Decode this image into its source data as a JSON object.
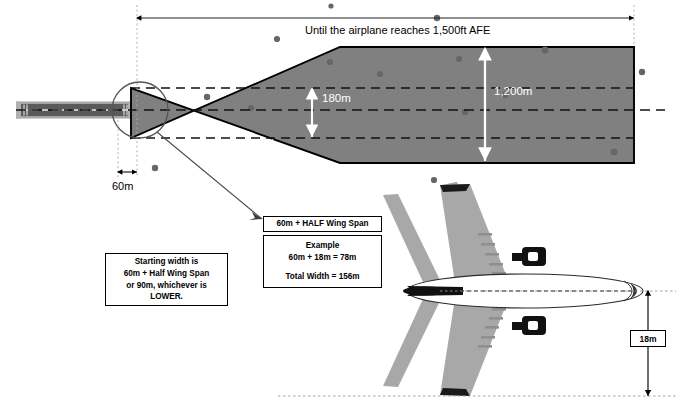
{
  "diagram": {
    "title_note": "Until the airplane reaches 1,500ft AFE",
    "splay": {
      "upper_percent_label": "12.5%",
      "lower_percent_label": "12.5%",
      "inner_corridor_label": "180m",
      "full_width_label": "1,200m",
      "start_width_label": "60m"
    },
    "notes": {
      "starting_width_box": {
        "line1": "Starting width is",
        "line2": "60m + Half Wing Span",
        "line3": "or 90m, whichever is",
        "line4": "LOWER."
      },
      "half_span_box": {
        "title": "60m + HALF Wing Span"
      },
      "example_box": {
        "heading": "Example",
        "calc": "60m + 18m = 78m",
        "total": "Total Width = 156m"
      }
    },
    "aircraft": {
      "half_span_badge": "18m"
    },
    "colors": {
      "splay_fill": "#808080",
      "splay_stroke": "#000000",
      "runway_fill": "#5a5a5a",
      "runway_edge": "#9a9a9a",
      "aircraft_wing": "#a8a8a8",
      "aircraft_body": "#ffffff",
      "aircraft_dark": "#111111",
      "white_text": "#ffffff",
      "black_text": "#000000",
      "speckle": "#6b6b6b"
    }
  }
}
